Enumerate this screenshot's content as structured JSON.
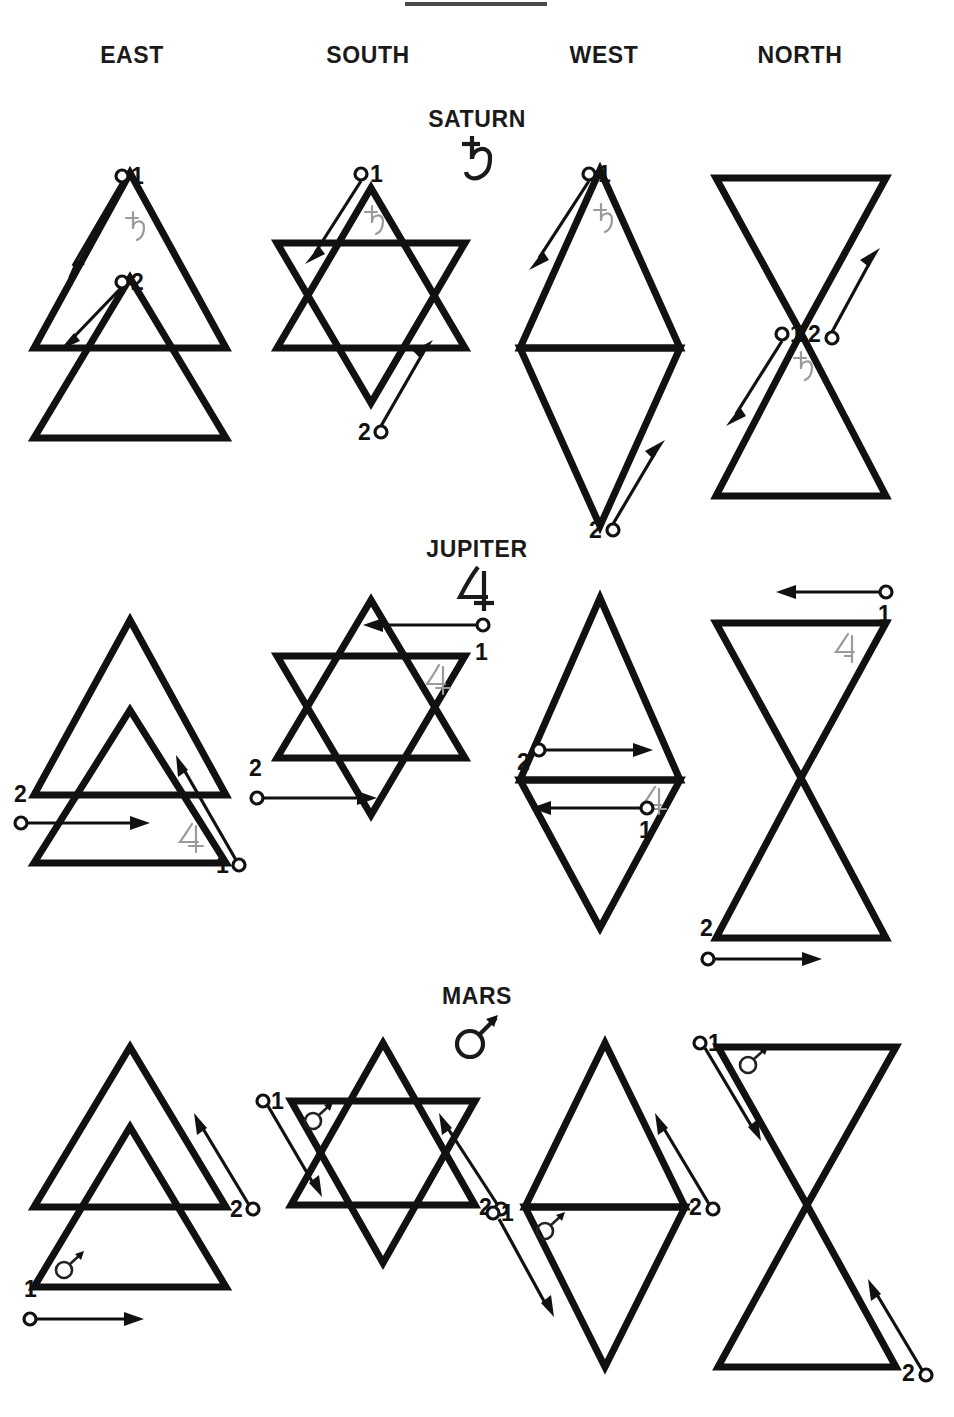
{
  "page": {
    "has_top_rule": true,
    "background": "#ffffff",
    "ink": "#111111"
  },
  "columns": [
    {
      "id": "east",
      "label": "EAST"
    },
    {
      "id": "south",
      "label": "SOUTH"
    },
    {
      "id": "west",
      "label": "WEST"
    },
    {
      "id": "north",
      "label": "NORTH"
    }
  ],
  "planets": [
    {
      "id": "saturn",
      "name": "SATURN",
      "glyph": "saturn-symbol",
      "glyph_char": "♄"
    },
    {
      "id": "jupiter",
      "name": "JUPITER",
      "glyph": "jupiter-symbol",
      "glyph_char": "♃"
    },
    {
      "id": "mars",
      "name": "MARS",
      "glyph": "mars-symbol",
      "glyph_char": "♂"
    }
  ],
  "figures": [
    {
      "planet": "SATURN",
      "quarter": "EAST",
      "shape": "two-stacked-upright-triangles",
      "inner_glyph": "saturn-symbol",
      "strokes": [
        {
          "label": "1",
          "start": "upper-apex-left",
          "direction": "down-left"
        },
        {
          "label": "2",
          "start": "inner-apex-left",
          "direction": "down-left"
        }
      ]
    },
    {
      "planet": "SATURN",
      "quarter": "SOUTH",
      "shape": "hexagram",
      "inner_glyph": "saturn-symbol",
      "strokes": [
        {
          "label": "1",
          "start": "top-apex",
          "direction": "down-left"
        },
        {
          "label": "2",
          "start": "bottom-apex",
          "direction": "up-right"
        }
      ]
    },
    {
      "planet": "SATURN",
      "quarter": "WEST",
      "shape": "vertical-rhombus",
      "inner_glyph": "saturn-symbol",
      "strokes": [
        {
          "label": "1",
          "start": "top-apex",
          "direction": "down-left"
        },
        {
          "label": "2",
          "start": "bottom-apex",
          "direction": "up-right"
        }
      ]
    },
    {
      "planet": "SATURN",
      "quarter": "NORTH",
      "shape": "hourglass",
      "inner_glyph": "saturn-symbol",
      "strokes": [
        {
          "label": "1",
          "start": "center",
          "direction": "down-left"
        },
        {
          "label": "2",
          "start": "center",
          "direction": "up-right"
        }
      ]
    },
    {
      "planet": "JUPITER",
      "quarter": "EAST",
      "shape": "two-stacked-upright-triangles",
      "inner_glyph": "jupiter-symbol",
      "strokes": [
        {
          "label": "1",
          "start": "lower-right",
          "direction": "up-left"
        },
        {
          "label": "2",
          "start": "left-outside",
          "direction": "right"
        }
      ]
    },
    {
      "planet": "JUPITER",
      "quarter": "SOUTH",
      "shape": "hexagram",
      "inner_glyph": "jupiter-symbol",
      "strokes": [
        {
          "label": "1",
          "start": "right-outside-upper",
          "direction": "left"
        },
        {
          "label": "2",
          "start": "left-outside-lower",
          "direction": "right"
        }
      ]
    },
    {
      "planet": "JUPITER",
      "quarter": "WEST",
      "shape": "vertical-rhombus",
      "inner_glyph": "jupiter-symbol",
      "strokes": [
        {
          "label": "2",
          "start": "left-vertex-above-bar",
          "direction": "right"
        },
        {
          "label": "1",
          "start": "right-inside-below-bar",
          "direction": "left"
        }
      ]
    },
    {
      "planet": "JUPITER",
      "quarter": "NORTH",
      "shape": "hourglass",
      "inner_glyph": "jupiter-symbol",
      "strokes": [
        {
          "label": "1",
          "start": "above-top-right",
          "direction": "left"
        },
        {
          "label": "2",
          "start": "below-bottom-left",
          "direction": "right"
        }
      ]
    },
    {
      "planet": "MARS",
      "quarter": "EAST",
      "shape": "two-stacked-upright-triangles",
      "inner_glyph": "mars-symbol",
      "strokes": [
        {
          "label": "1",
          "start": "below-bottom-left",
          "direction": "right"
        },
        {
          "label": "2",
          "start": "right-outside",
          "direction": "up-left"
        }
      ]
    },
    {
      "planet": "MARS",
      "quarter": "SOUTH",
      "shape": "hexagram",
      "inner_glyph": "mars-symbol",
      "strokes": [
        {
          "label": "1",
          "start": "upper-left-outside",
          "direction": "down-right"
        },
        {
          "label": "2",
          "start": "lower-right-outside",
          "direction": "up-left"
        }
      ]
    },
    {
      "planet": "MARS",
      "quarter": "WEST",
      "shape": "vertical-rhombus",
      "inner_glyph": "mars-symbol",
      "strokes": [
        {
          "label": "1",
          "start": "left-vertex",
          "direction": "down-right"
        },
        {
          "label": "2",
          "start": "right-vertex",
          "direction": "up-left"
        }
      ]
    },
    {
      "planet": "MARS",
      "quarter": "NORTH",
      "shape": "hourglass",
      "inner_glyph": "mars-symbol",
      "strokes": [
        {
          "label": "1",
          "start": "top-left-corner",
          "direction": "down-right"
        },
        {
          "label": "2",
          "start": "bottom-right-corner",
          "direction": "up-left"
        }
      ]
    }
  ],
  "labels": {
    "one": "1",
    "two": "2"
  }
}
